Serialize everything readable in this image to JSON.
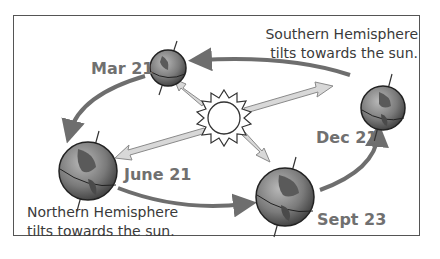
{
  "diagram": {
    "colors": {
      "orbit_arrow": "#6e6e6e",
      "sun_ray_arrow": "#cfcfcf",
      "frame": "#555555",
      "date_text": "#707070",
      "caption_text": "#3a3a3a"
    },
    "positions": [
      {
        "id": "mar",
        "label": "Mar 21"
      },
      {
        "id": "june",
        "label": "June 21"
      },
      {
        "id": "sept",
        "label": "Sept 23"
      },
      {
        "id": "dec",
        "label": "Dec 21"
      }
    ],
    "captions": {
      "southern": [
        "Southern Hemisphere",
        "tilts towards the sun."
      ],
      "northern": [
        "Northern Hemisphere",
        "tilts towards the sun."
      ]
    },
    "center": {
      "icon": "sun-icon"
    }
  }
}
